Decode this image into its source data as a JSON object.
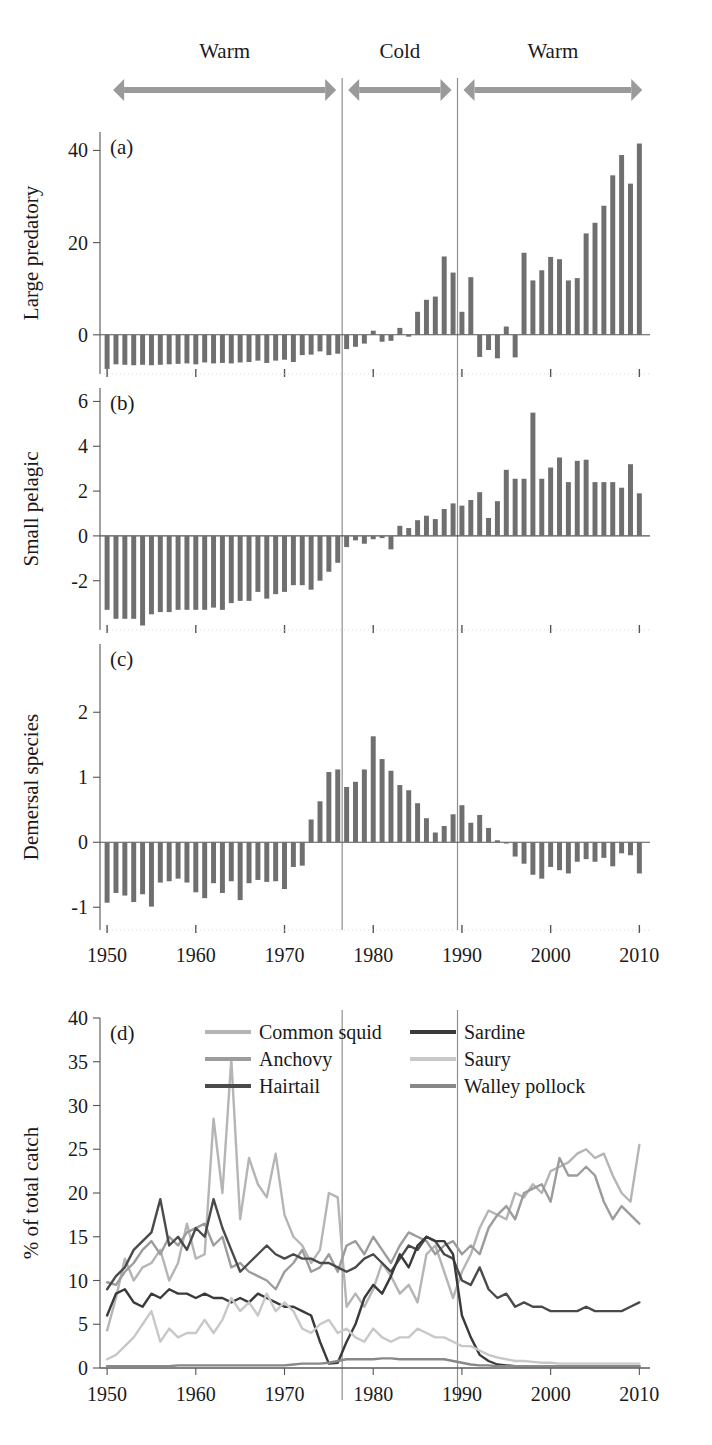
{
  "figure": {
    "phases": [
      {
        "label": "Warm",
        "start_year": 1950,
        "end_year": 1976.5
      },
      {
        "label": "Cold",
        "start_year": 1976.5,
        "end_year": 1989.5
      },
      {
        "label": "Warm",
        "start_year": 1989.5,
        "end_year": 2011
      }
    ],
    "regime_shift_years": [
      1976.5,
      1989.5
    ],
    "colors": {
      "bar": "#6f6f6f",
      "axis": "#555555",
      "arrow": "#9a9a9a",
      "divider": "#8f8f8f",
      "text": "#1a1a1a"
    }
  },
  "chart_data": [
    {
      "type": "bar",
      "panel": "(a)",
      "title": "",
      "xlabel": "",
      "ylabel": "Large predatory",
      "xlim": [
        1949.2,
        2011.2
      ],
      "ylim": [
        -8.5,
        44
      ],
      "yticks": [
        0,
        20,
        40
      ],
      "ytick_labels": [
        "0",
        "20",
        "40"
      ],
      "xticks": [
        1950,
        1960,
        1970,
        1980,
        1990,
        2000,
        2010
      ],
      "grid": false,
      "x": [
        1950,
        1951,
        1952,
        1953,
        1954,
        1955,
        1956,
        1957,
        1958,
        1959,
        1960,
        1961,
        1962,
        1963,
        1964,
        1965,
        1966,
        1967,
        1968,
        1969,
        1970,
        1971,
        1972,
        1973,
        1974,
        1975,
        1976,
        1977,
        1978,
        1979,
        1980,
        1981,
        1982,
        1983,
        1984,
        1985,
        1986,
        1987,
        1988,
        1989,
        1990,
        1991,
        1992,
        1993,
        1994,
        1995,
        1996,
        1997,
        1998,
        1999,
        2000,
        2001,
        2002,
        2003,
        2004,
        2005,
        2006,
        2007,
        2008,
        2009,
        2010
      ],
      "values": [
        -7.4,
        -6.4,
        -6.5,
        -6.6,
        -6.5,
        -6.6,
        -6.5,
        -6.4,
        -6.3,
        -6.2,
        -6.4,
        -6.0,
        -6.2,
        -6.1,
        -6.2,
        -6.0,
        -5.9,
        -5.6,
        -6.1,
        -5.6,
        -5.4,
        -5.9,
        -4.4,
        -4.3,
        -3.6,
        -4.4,
        -4.1,
        -3.1,
        -2.6,
        -1.9,
        0.9,
        -1.5,
        -1.3,
        1.5,
        -0.4,
        5.0,
        7.6,
        8.3,
        17.0,
        13.5,
        5.0,
        12.5,
        -4.8,
        -3.3,
        -5.1,
        1.8,
        -4.9,
        17.8,
        11.8,
        14.0,
        16.9,
        16.4,
        11.8,
        12.3,
        22.0,
        24.3,
        28.0,
        34.6,
        39.0,
        32.8,
        41.5
      ]
    },
    {
      "type": "bar",
      "panel": "(b)",
      "title": "",
      "xlabel": "",
      "ylabel": "Small pelagic",
      "xlim": [
        1949.2,
        2011.2
      ],
      "ylim": [
        -4.2,
        6.6
      ],
      "yticks": [
        -2,
        0,
        2,
        4,
        6
      ],
      "ytick_labels": [
        "-2",
        "0",
        "2",
        "4",
        "6"
      ],
      "xticks": [
        1950,
        1960,
        1970,
        1980,
        1990,
        2000,
        2010
      ],
      "grid": false,
      "x": [
        1950,
        1951,
        1952,
        1953,
        1954,
        1955,
        1956,
        1957,
        1958,
        1959,
        1960,
        1961,
        1962,
        1963,
        1964,
        1965,
        1966,
        1967,
        1968,
        1969,
        1970,
        1971,
        1972,
        1973,
        1974,
        1975,
        1976,
        1977,
        1978,
        1979,
        1980,
        1981,
        1982,
        1983,
        1984,
        1985,
        1986,
        1987,
        1988,
        1989,
        1990,
        1991,
        1992,
        1993,
        1994,
        1995,
        1996,
        1997,
        1998,
        1999,
        2000,
        2001,
        2002,
        2003,
        2004,
        2005,
        2006,
        2007,
        2008,
        2009,
        2010
      ],
      "values": [
        -3.3,
        -3.7,
        -3.7,
        -3.7,
        -4.0,
        -3.5,
        -3.4,
        -3.4,
        -3.3,
        -3.3,
        -3.3,
        -3.3,
        -3.2,
        -3.3,
        -3.0,
        -2.9,
        -2.9,
        -2.5,
        -2.8,
        -2.6,
        -2.5,
        -2.2,
        -2.2,
        -2.4,
        -2.0,
        -1.6,
        -1.2,
        -0.5,
        -0.2,
        -0.35,
        -0.15,
        -0.1,
        -0.6,
        0.45,
        0.35,
        0.7,
        0.9,
        0.75,
        1.2,
        1.45,
        1.35,
        1.6,
        1.95,
        0.8,
        1.55,
        2.95,
        2.55,
        2.55,
        5.5,
        2.55,
        3.05,
        3.5,
        2.4,
        3.35,
        3.4,
        2.4,
        2.4,
        2.4,
        2.15,
        3.2,
        1.9
      ]
    },
    {
      "type": "bar",
      "panel": "(c)",
      "title": "",
      "xlabel": "",
      "ylabel": "Demersal species",
      "xlim": [
        1949.2,
        2011.2
      ],
      "ylim": [
        -1.35,
        3.05
      ],
      "yticks": [
        -1,
        0,
        1,
        2
      ],
      "ytick_labels": [
        "-1",
        "0",
        "1",
        "2"
      ],
      "xticks": [
        1950,
        1960,
        1970,
        1980,
        1990,
        2000,
        2010
      ],
      "xtick_labels": [
        "1950",
        "1960",
        "1970",
        "1980",
        "1990",
        "2000",
        "2010"
      ],
      "grid": false,
      "x": [
        1950,
        1951,
        1952,
        1953,
        1954,
        1955,
        1956,
        1957,
        1958,
        1959,
        1960,
        1961,
        1962,
        1963,
        1964,
        1965,
        1966,
        1967,
        1968,
        1969,
        1970,
        1971,
        1972,
        1973,
        1974,
        1975,
        1976,
        1977,
        1978,
        1979,
        1980,
        1981,
        1982,
        1983,
        1984,
        1985,
        1986,
        1987,
        1988,
        1989,
        1990,
        1991,
        1992,
        1993,
        1994,
        1995,
        1996,
        1997,
        1998,
        1999,
        2000,
        2001,
        2002,
        2003,
        2004,
        2005,
        2006,
        2007,
        2008,
        2009,
        2010
      ],
      "values": [
        -0.93,
        -0.78,
        -0.82,
        -0.92,
        -0.8,
        -0.99,
        -0.62,
        -0.6,
        -0.56,
        -0.62,
        -0.77,
        -0.86,
        -0.63,
        -0.78,
        -0.6,
        -0.89,
        -0.63,
        -0.58,
        -0.61,
        -0.6,
        -0.72,
        -0.38,
        -0.36,
        0.35,
        0.63,
        1.08,
        1.12,
        0.85,
        0.93,
        1.12,
        1.63,
        1.28,
        1.1,
        0.88,
        0.8,
        0.6,
        0.37,
        0.15,
        0.25,
        0.43,
        0.57,
        0.3,
        0.42,
        0.22,
        0.03,
        -0.02,
        -0.22,
        -0.33,
        -0.5,
        -0.56,
        -0.38,
        -0.43,
        -0.48,
        -0.3,
        -0.26,
        -0.3,
        -0.24,
        -0.37,
        -0.17,
        -0.2,
        -0.48
      ]
    },
    {
      "type": "line",
      "panel": "(d)",
      "title": "",
      "xlabel": "",
      "ylabel": "% of total catch",
      "xlim": [
        1949.2,
        2011.2
      ],
      "ylim": [
        0,
        40
      ],
      "yticks": [
        0,
        5,
        10,
        15,
        20,
        25,
        30,
        35,
        40
      ],
      "ytick_labels": [
        "0",
        "5",
        "10",
        "15",
        "20",
        "25",
        "30",
        "35",
        "40"
      ],
      "xticks": [
        1950,
        1960,
        1970,
        1980,
        1990,
        2000,
        2010
      ],
      "xtick_labels": [
        "1950",
        "1960",
        "1970",
        "1980",
        "1990",
        "2000",
        "2010"
      ],
      "grid": false,
      "legend_position": "top-inside",
      "legend_columns": [
        [
          "Common squid",
          "Anchovy",
          "Hairtail"
        ],
        [
          "Sardine",
          "Saury",
          "Walley pollock"
        ]
      ],
      "x": [
        1950,
        1951,
        1952,
        1953,
        1954,
        1955,
        1956,
        1957,
        1958,
        1959,
        1960,
        1961,
        1962,
        1963,
        1964,
        1965,
        1966,
        1967,
        1968,
        1969,
        1970,
        1971,
        1972,
        1973,
        1974,
        1975,
        1976,
        1977,
        1978,
        1979,
        1980,
        1981,
        1982,
        1983,
        1984,
        1985,
        1986,
        1987,
        1988,
        1989,
        1990,
        1991,
        1992,
        1993,
        1994,
        1995,
        1996,
        1997,
        1998,
        1999,
        2000,
        2001,
        2002,
        2003,
        2004,
        2005,
        2006,
        2007,
        2008,
        2009,
        2010
      ],
      "series": [
        {
          "name": "Common squid",
          "color": "#b5b5b5",
          "values": [
            4.3,
            8.0,
            12.5,
            10.0,
            11.5,
            12.0,
            13.5,
            10.0,
            12.0,
            16.5,
            12.5,
            13.0,
            28.5,
            20.0,
            35.3,
            17.0,
            24.0,
            21.0,
            19.5,
            24.5,
            17.5,
            15.0,
            14.0,
            12.0,
            13.5,
            20.0,
            19.5,
            7.0,
            8.5,
            7.0,
            9.0,
            12.0,
            10.5,
            8.5,
            9.5,
            7.5,
            13.0,
            14.0,
            11.0,
            8.0,
            11.0,
            13.0,
            16.0,
            18.0,
            17.5,
            17.0,
            20.0,
            19.5,
            21.0,
            20.0,
            22.5,
            23.0,
            23.5,
            24.5,
            25.0,
            24.0,
            24.5,
            22.0,
            20.0,
            19.0,
            25.5
          ]
        },
        {
          "name": "Anchovy",
          "color": "#9c9c9c",
          "values": [
            9.8,
            9.5,
            11.0,
            12.0,
            13.5,
            14.5,
            13.0,
            15.0,
            14.0,
            15.5,
            16.0,
            16.5,
            14.0,
            15.0,
            11.5,
            12.0,
            11.0,
            10.5,
            10.0,
            9.0,
            11.0,
            12.0,
            13.5,
            11.0,
            11.5,
            13.0,
            11.0,
            14.0,
            14.5,
            13.0,
            15.0,
            13.5,
            12.0,
            14.0,
            15.5,
            15.0,
            14.5,
            13.0,
            14.0,
            14.5,
            13.0,
            14.0,
            13.0,
            16.0,
            17.5,
            18.5,
            17.0,
            20.0,
            20.5,
            21.0,
            19.0,
            24.0,
            22.0,
            22.0,
            23.0,
            22.0,
            19.0,
            17.0,
            18.5,
            17.5,
            16.5
          ]
        },
        {
          "name": "Hairtail",
          "color": "#4a4a4a",
          "values": [
            9.0,
            10.5,
            11.5,
            13.5,
            14.5,
            15.5,
            19.3,
            14.0,
            15.0,
            13.5,
            16.0,
            15.0,
            19.3,
            16.0,
            13.5,
            11.0,
            12.0,
            13.0,
            14.0,
            13.0,
            12.5,
            13.0,
            12.5,
            12.5,
            12.0,
            12.0,
            11.5,
            11.0,
            11.5,
            12.5,
            13.0,
            12.0,
            11.0,
            12.5,
            14.0,
            13.5,
            15.0,
            14.5,
            13.0,
            12.5,
            10.0,
            9.5,
            11.5,
            9.0,
            8.0,
            8.5,
            7.0,
            7.5,
            7.0,
            7.0,
            6.5,
            6.5,
            6.5,
            6.5,
            7.0,
            6.5,
            6.5,
            6.5,
            6.5,
            7.0,
            7.5
          ]
        },
        {
          "name": "Sardine",
          "color": "#3a3a3a",
          "values": [
            6.0,
            8.5,
            9.0,
            7.5,
            7.0,
            8.5,
            8.0,
            9.0,
            8.5,
            8.5,
            8.0,
            8.5,
            8.0,
            8.0,
            7.5,
            8.0,
            7.5,
            8.5,
            8.0,
            7.5,
            7.0,
            7.0,
            6.5,
            6.0,
            3.0,
            0.5,
            0.6,
            3.0,
            5.0,
            8.0,
            9.5,
            8.5,
            10.5,
            13.0,
            11.5,
            14.0,
            15.0,
            14.5,
            14.5,
            13.0,
            6.0,
            3.5,
            1.5,
            0.8,
            0.4,
            0.3,
            0.2,
            0.2,
            0.2,
            0.2,
            0.2,
            0.2,
            0.2,
            0.2,
            0.2,
            0.2,
            0.2,
            0.2,
            0.2,
            0.2,
            0.2
          ]
        },
        {
          "name": "Saury",
          "color": "#c8c8c8",
          "values": [
            1.0,
            1.5,
            2.5,
            3.5,
            5.0,
            6.5,
            3.0,
            4.5,
            3.5,
            4.0,
            4.0,
            5.5,
            4.0,
            5.5,
            8.0,
            6.5,
            7.5,
            6.0,
            8.5,
            6.5,
            7.5,
            6.5,
            4.5,
            4.0,
            5.0,
            5.5,
            4.0,
            4.5,
            3.5,
            3.0,
            4.5,
            3.5,
            3.0,
            3.5,
            3.5,
            4.5,
            4.0,
            3.5,
            3.5,
            3.0,
            2.5,
            2.5,
            2.0,
            1.5,
            1.2,
            1.0,
            0.8,
            0.8,
            0.7,
            0.6,
            0.6,
            0.5,
            0.5,
            0.5,
            0.5,
            0.5,
            0.5,
            0.5,
            0.5,
            0.5,
            0.5
          ]
        },
        {
          "name": "Walley pollock",
          "color": "#888888",
          "values": [
            0.2,
            0.2,
            0.2,
            0.2,
            0.2,
            0.2,
            0.2,
            0.2,
            0.3,
            0.3,
            0.3,
            0.3,
            0.3,
            0.3,
            0.3,
            0.3,
            0.3,
            0.3,
            0.3,
            0.3,
            0.3,
            0.4,
            0.5,
            0.5,
            0.5,
            0.6,
            0.8,
            1.0,
            1.0,
            1.0,
            1.0,
            1.1,
            1.1,
            1.0,
            1.0,
            1.0,
            1.0,
            1.0,
            1.0,
            0.8,
            0.6,
            0.4,
            0.3,
            0.3,
            0.2,
            0.2,
            0.2,
            0.2,
            0.2,
            0.2,
            0.2,
            0.2,
            0.2,
            0.2,
            0.2,
            0.2,
            0.2,
            0.2,
            0.2,
            0.2,
            0.2
          ]
        }
      ]
    }
  ]
}
